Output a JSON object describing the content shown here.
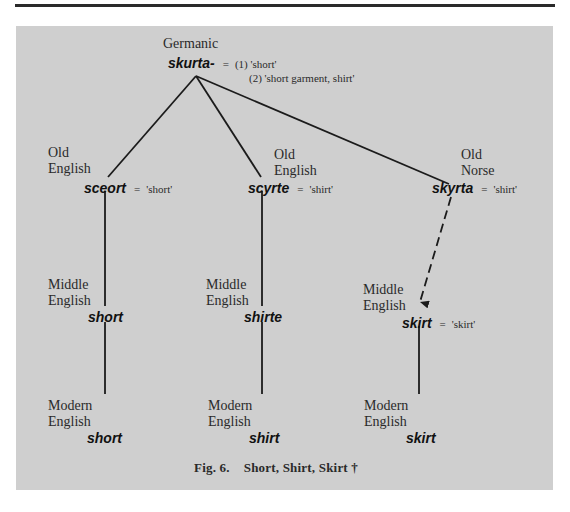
{
  "figure": {
    "caption_number": "Fig. 6.",
    "caption_title": "Short, Shirt, Skirt †"
  },
  "root": {
    "language": "Germanic",
    "form": "skurta-",
    "equals": "=",
    "gloss1": "(1) 'short'",
    "gloss2": "(2) 'short garment, shirt'"
  },
  "branches": [
    {
      "old": {
        "lang1": "Old",
        "lang2": "English",
        "form": "sceort",
        "equals": "=",
        "gloss": "'short'"
      },
      "middle": {
        "lang1": "Middle",
        "lang2": "English",
        "form": "short"
      },
      "modern": {
        "lang1": "Modern",
        "lang2": "English",
        "form": "short"
      }
    },
    {
      "old": {
        "lang1": "Old",
        "lang2": "English",
        "form": "scyrte",
        "equals": "=",
        "gloss": "'shirt'"
      },
      "middle": {
        "lang1": "Middle",
        "lang2": "English",
        "form": "shirte"
      },
      "modern": {
        "lang1": "Modern",
        "lang2": "English",
        "form": "shirt"
      }
    },
    {
      "old": {
        "lang1": "Old",
        "lang2": "Norse",
        "form": "skyrta",
        "equals": "=",
        "gloss": "'shirt'"
      },
      "middle": {
        "lang1": "Middle",
        "lang2": "English",
        "form": "skirt",
        "equals": "=",
        "gloss": "'skirt'",
        "borrowed": true
      },
      "modern": {
        "lang1": "Modern",
        "lang2": "English",
        "form": "skirt"
      }
    }
  ],
  "colors": {
    "panel": "#cfcfcf",
    "line": "#1b1b1b",
    "rule": "#2a2a2a"
  }
}
